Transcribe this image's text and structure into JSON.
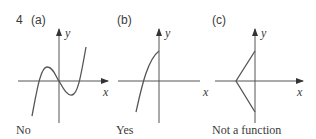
{
  "question_number": "4",
  "panels": [
    {
      "label": "(a)",
      "answer": "No",
      "x_axis": "x",
      "y_axis": "y"
    },
    {
      "label": "(b)",
      "answer": "Yes",
      "x_axis": "x",
      "y_axis": "y"
    },
    {
      "label": "(c)",
      "answer": "Not a function",
      "x_axis": "x",
      "y_axis": "y"
    }
  ],
  "colors": {
    "line": "#555555",
    "text": "#3a3a3a"
  }
}
